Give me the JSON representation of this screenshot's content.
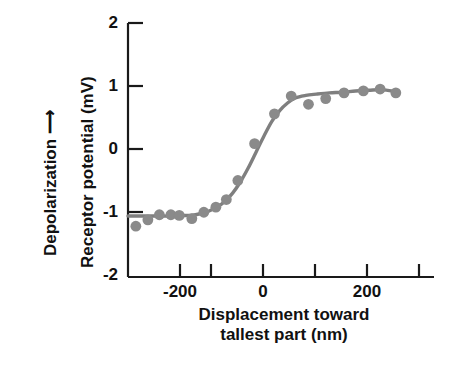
{
  "figure": {
    "title": "",
    "background_color": "#ffffff",
    "axis_color": "#1a1a1a",
    "data_color": "#8a8a8a",
    "curve_color": "#7f7f7f"
  },
  "labels": {
    "depolarization": "Depolarization ⟶",
    "y_axis": "Receptor potential (mV)",
    "x_axis_line1": "Displacement toward",
    "x_axis_line2": "tallest part (nm)"
  },
  "ticks": {
    "y": [
      "2",
      "1",
      "0",
      "-1",
      "-2"
    ],
    "x_labeled": [
      "-200",
      "0",
      "200"
    ]
  },
  "chart_data": {
    "type": "scatter",
    "title": "",
    "xlabel": "Displacement toward tallest part (nm)",
    "ylabel": "Receptor potential (mV)",
    "secondary_ylabel": "Depolarization →",
    "xlim": [
      -250,
      335
    ],
    "ylim": [
      -2,
      2
    ],
    "xticks": [
      -250,
      -200,
      -150,
      -100,
      -50,
      0,
      50,
      100,
      150,
      200,
      250,
      300
    ],
    "xtick_labels": [
      "",
      "-200",
      "",
      "",
      "",
      "0",
      "",
      "",
      "",
      "200",
      "",
      ""
    ],
    "yticks": [
      -2,
      -1,
      0,
      1,
      2
    ],
    "ytick_labels": [
      "-2",
      "-1",
      "0",
      "1",
      "2"
    ],
    "grid": false,
    "legend": false,
    "marker": "circle",
    "marker_color": "#8a8a8a",
    "line_color": "#7f7f7f",
    "points": [
      {
        "x": -235,
        "y": -1.2
      },
      {
        "x": -212,
        "y": -1.1
      },
      {
        "x": -190,
        "y": -1.02
      },
      {
        "x": -168,
        "y": -1.02
      },
      {
        "x": -152,
        "y": -1.03
      },
      {
        "x": -128,
        "y": -1.08
      },
      {
        "x": -105,
        "y": -0.98
      },
      {
        "x": -82,
        "y": -0.9
      },
      {
        "x": -62,
        "y": -0.78
      },
      {
        "x": -40,
        "y": -0.48
      },
      {
        "x": -8,
        "y": 0.1
      },
      {
        "x": 30,
        "y": 0.57
      },
      {
        "x": 62,
        "y": 0.85
      },
      {
        "x": 95,
        "y": 0.72
      },
      {
        "x": 128,
        "y": 0.81
      },
      {
        "x": 163,
        "y": 0.9
      },
      {
        "x": 200,
        "y": 0.93
      },
      {
        "x": 232,
        "y": 0.96
      },
      {
        "x": 262,
        "y": 0.9
      }
    ],
    "fit_curve": {
      "description": "sigmoid fit through data",
      "x": [
        -250,
        -230,
        -210,
        -190,
        -170,
        -150,
        -130,
        -110,
        -95,
        -80,
        -65,
        -50,
        -35,
        -20,
        -5,
        10,
        25,
        40,
        55,
        70,
        90,
        110,
        135,
        160,
        185,
        210,
        235,
        262
      ],
      "y": [
        -1.04,
        -1.04,
        -1.04,
        -1.04,
        -1.04,
        -1.03,
        -1.03,
        -1.0,
        -0.96,
        -0.9,
        -0.81,
        -0.68,
        -0.5,
        -0.28,
        -0.03,
        0.22,
        0.45,
        0.62,
        0.74,
        0.82,
        0.86,
        0.88,
        0.9,
        0.91,
        0.93,
        0.94,
        0.95,
        0.92
      ]
    }
  }
}
